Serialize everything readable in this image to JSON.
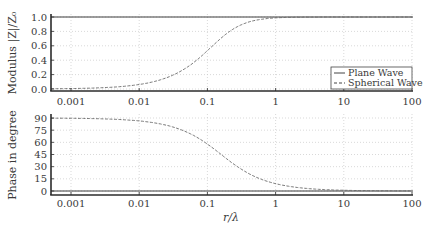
{
  "chart_data": [
    {
      "type": "line",
      "panel": "top",
      "title": "",
      "xlabel": "",
      "ylabel": "Modulus |Z|/Z0",
      "xscale": "log",
      "xlim": [
        0.0005,
        100
      ],
      "ylim": [
        -0.05,
        1.02
      ],
      "xticks": [
        0.001,
        0.01,
        0.1,
        1,
        10,
        100
      ],
      "xtick_labels": [
        "0.001",
        "0.01",
        "0.1",
        "1",
        "10",
        "100"
      ],
      "yticks": [
        0.0,
        0.2,
        0.4,
        0.6,
        0.8,
        1.0
      ],
      "ytick_labels": [
        "0.0",
        "0.2",
        "0.4",
        "0.6",
        "0.8",
        "1.0"
      ],
      "grid": true,
      "legend_position": "lower right",
      "x": [
        0.0005,
        0.001,
        0.002,
        0.005,
        0.01,
        0.02,
        0.05,
        0.1,
        0.2,
        0.5,
        1,
        2,
        5,
        10,
        20,
        50,
        100
      ],
      "series": [
        {
          "name": "Plane Wave",
          "style": "solid",
          "values": [
            1,
            1,
            1,
            1,
            1,
            1,
            1,
            1,
            1,
            1,
            1,
            1,
            1,
            1,
            1,
            1,
            1
          ]
        },
        {
          "name": "Spherical Wave",
          "style": "dashed",
          "values": [
            0.003,
            0.006,
            0.013,
            0.031,
            0.063,
            0.125,
            0.3,
            0.532,
            0.782,
            0.953,
            0.988,
            0.997,
            1.0,
            1.0,
            1.0,
            1.0,
            1.0
          ]
        }
      ]
    },
    {
      "type": "line",
      "panel": "bottom",
      "title": "",
      "xlabel": "r/λ",
      "ylabel": "Phase in degree",
      "xscale": "log",
      "xlim": [
        0.0005,
        100
      ],
      "ylim": [
        -5,
        92
      ],
      "xticks": [
        0.001,
        0.01,
        0.1,
        1,
        10,
        100
      ],
      "xtick_labels": [
        "0.001",
        "0.01",
        "0.1",
        "1",
        "10",
        "100"
      ],
      "yticks": [
        0,
        15,
        30,
        45,
        60,
        75,
        90
      ],
      "ytick_labels": [
        "0",
        "15",
        "30",
        "45",
        "60",
        "75",
        "90"
      ],
      "grid": true,
      "x": [
        0.0005,
        0.001,
        0.002,
        0.005,
        0.01,
        0.02,
        0.05,
        0.1,
        0.2,
        0.5,
        1,
        2,
        5,
        10,
        20,
        50,
        100
      ],
      "series": [
        {
          "name": "Plane Wave",
          "style": "solid",
          "values": [
            0,
            0,
            0,
            0,
            0,
            0,
            0,
            0,
            0,
            0,
            0,
            0,
            0,
            0,
            0,
            0,
            0
          ]
        },
        {
          "name": "Spherical Wave",
          "style": "dashed",
          "values": [
            89.8,
            89.6,
            89.3,
            88.2,
            86.4,
            82.8,
            72.3,
            57.9,
            38.5,
            17.7,
            9.0,
            4.6,
            1.8,
            0.9,
            0.5,
            0.2,
            0.1
          ]
        }
      ]
    }
  ],
  "legend": {
    "items": [
      {
        "label": "Plane Wave",
        "style": "solid"
      },
      {
        "label": "Spherical Wave",
        "style": "dashed"
      }
    ]
  },
  "labels": {
    "top_ylabel": "Modulus |Z|/Z₀",
    "bottom_ylabel": "Phase in degree",
    "xlabel": "r/λ"
  },
  "colors": {
    "axis": "#2b2b2b",
    "line": "#555555",
    "grid": "#c8c8c8",
    "text": "#3a3a3a"
  }
}
